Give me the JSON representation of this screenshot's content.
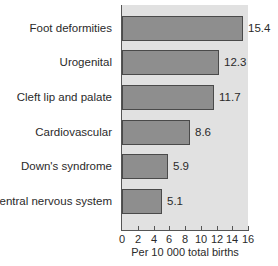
{
  "chart_data": {
    "type": "bar",
    "orientation": "horizontal",
    "title": "",
    "categories": [
      "Foot deformities",
      "Urogenital",
      "Cleft lip and palate",
      "Cardiovascular",
      "Down's syndrome",
      "Central nervous system"
    ],
    "values": [
      15.4,
      12.3,
      11.7,
      8.6,
      5.9,
      5.1
    ],
    "value_labels": [
      "15.4",
      "12.3",
      "11.7",
      "8.6",
      "5.9",
      "5.1"
    ],
    "xlabel": "Per 10 000 total births",
    "ylabel": "",
    "xlim": [
      0,
      16
    ],
    "xticks": [
      "0",
      "2",
      "4",
      "6",
      "8",
      "10",
      "12",
      "14",
      "16"
    ],
    "grid": false,
    "legend": null,
    "colors": {
      "bar": "#8e8e8e",
      "bar_border": "#4a4a4a",
      "plot_background": "#e1e1e1"
    }
  }
}
